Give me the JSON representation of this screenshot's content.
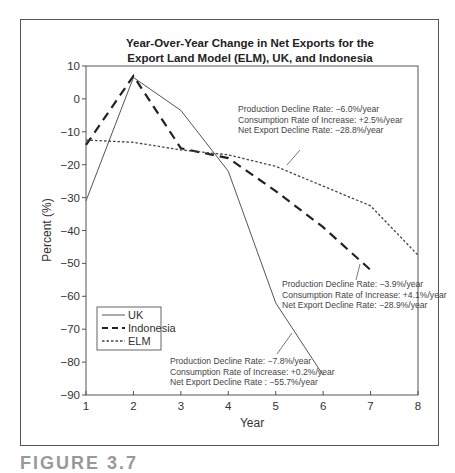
{
  "chart_data": {
    "type": "line",
    "title": "Year-Over-Year Change in Net Exports for the Export Land Model (ELM), UK, and Indonesia",
    "title_lines": [
      "Year-Over-Year Change in Net Exports for the",
      "Export Land Model (ELM), UK, and Indonesia"
    ],
    "xlabel": "Year",
    "ylabel": "Percent (%)",
    "xlim": [
      1,
      8
    ],
    "ylim": [
      -90,
      10
    ],
    "xticks": [
      1,
      2,
      3,
      4,
      5,
      6,
      7,
      8
    ],
    "yticks": [
      10,
      0,
      -10,
      -20,
      -30,
      -40,
      -50,
      -60,
      -70,
      -80,
      -90
    ],
    "ytick_labels": [
      "10",
      "0",
      "−10",
      "−20",
      "−30",
      "−40",
      "−50",
      "−60",
      "−70",
      "−80",
      "−90"
    ],
    "grid": false,
    "legend_position": "lower left",
    "series": [
      {
        "name": "UK",
        "style": "solid",
        "color": "#555555",
        "x": [
          1,
          2,
          3,
          4,
          5,
          6
        ],
        "values": [
          -31,
          6.5,
          -3.5,
          -22,
          -62,
          -84
        ]
      },
      {
        "name": "Indonesia",
        "style": "dashed",
        "color": "#222222",
        "x": [
          1,
          2,
          3,
          4,
          5,
          6,
          7
        ],
        "values": [
          -14,
          7,
          -15,
          -18,
          -28,
          -39,
          -52
        ]
      },
      {
        "name": "ELM",
        "style": "dotted",
        "color": "#444444",
        "x": [
          1,
          2,
          3,
          4,
          5,
          6,
          7,
          8
        ],
        "values": [
          -12.5,
          -13.2,
          -15.5,
          -17,
          -20.5,
          -26.5,
          -32.5,
          -47.5
        ]
      }
    ],
    "annotations": [
      {
        "target": "ELM",
        "lines": [
          "Production Decline Rate: −6.0%/year",
          "Consumption Rate of Increase: +2.5%/year",
          "Net Export Decline Rate: −28.8%/year"
        ],
        "text_x": 238,
        "text_y": 112,
        "leader": [
          300,
          150,
          287,
          165
        ]
      },
      {
        "target": "Indonesia",
        "lines": [
          "Production Decline Rate: −3.9%/year",
          "Consumption Rate of Increase: +4.1%/year",
          "Net Export Decline Rate: −28.9%/year"
        ],
        "text_x": 282,
        "text_y": 287,
        "leader": [
          360,
          264,
          356,
          280
        ]
      },
      {
        "target": "UK",
        "lines": [
          "Production Decline Rate: −7.8%/year",
          "Consumption Rate of Increase: +0.2%/year",
          "Net Export Decline Rate : −55.7%/year"
        ],
        "text_x": 170,
        "text_y": 364,
        "leader": [
          292,
          333,
          277,
          354
        ]
      }
    ]
  },
  "caption": "FIGURE 3.7"
}
